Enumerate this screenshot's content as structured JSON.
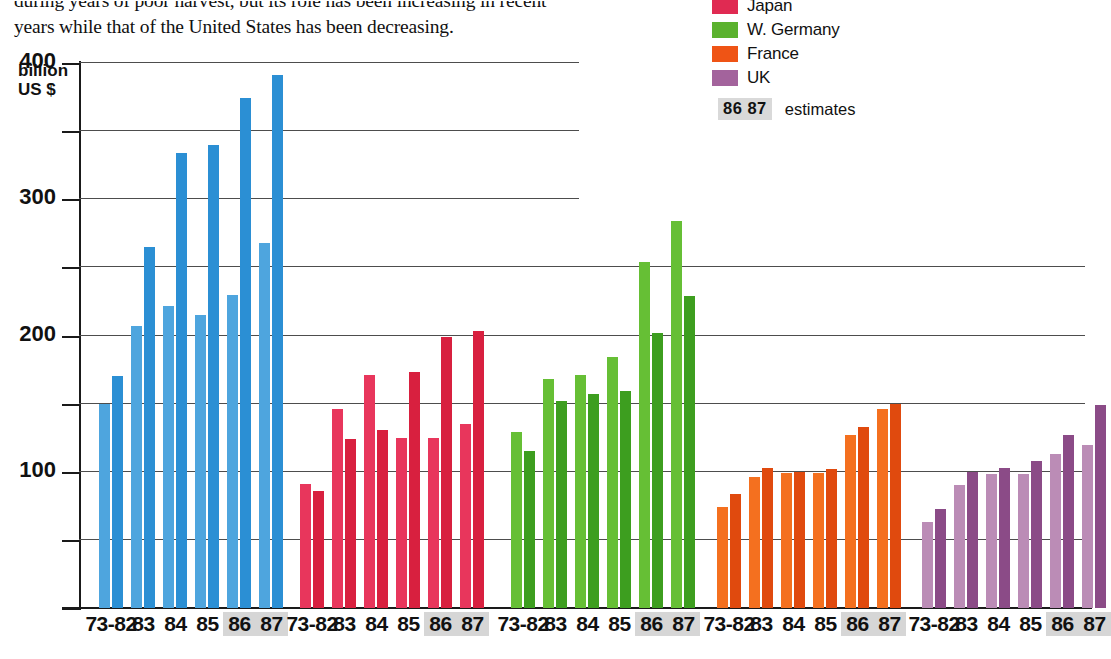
{
  "intro": {
    "line1": "during years of poor harvest, but its role has been increasing in recent",
    "line2": "years while that of the United States has been decreasing."
  },
  "caption": {
    "text": "World trade争 overall... in agricultural products, 1973- in current prices"
  },
  "legend": {
    "items": [
      {
        "label": "Japan",
        "color": "#e02a52"
      },
      {
        "label": "W. Germany",
        "color": "#5bb22e"
      },
      {
        "label": "France",
        "color": "#ef5415"
      },
      {
        "label": "UK",
        "color": "#a3639c"
      }
    ],
    "estimates": {
      "chip": "86 87",
      "word": "estimates"
    }
  },
  "axis": {
    "unit_line1": "billion",
    "unit_line2": "US $",
    "labels": [
      "400",
      "300",
      "200",
      "100"
    ]
  },
  "chart_data": {
    "type": "bar",
    "xlabel": "",
    "ylabel": "billion US $",
    "ylim": [
      0,
      400
    ],
    "yticks": [
      0,
      50,
      100,
      150,
      200,
      250,
      300,
      350,
      400
    ],
    "ytick_labels": [
      "",
      "",
      "100",
      "",
      "200",
      "",
      "300",
      "",
      "400"
    ],
    "grid": true,
    "legend_position": "top-right",
    "period_labels": [
      "73-82",
      "83",
      "84",
      "85",
      "86",
      "87"
    ],
    "estimate_periods": [
      "86",
      "87"
    ],
    "note": "each period shows a pair of bars (light = exports, dark = imports)",
    "series": [
      {
        "name": "United States",
        "color": "#2b8fd4",
        "color_light": "#4ea5de",
        "periods": [
          "73-82",
          "83",
          "84",
          "85",
          "86",
          "87"
        ],
        "values": [
          [
            150,
            170
          ],
          [
            207,
            265
          ],
          [
            222,
            334
          ],
          [
            215,
            340
          ],
          [
            230,
            374
          ],
          [
            268,
            391
          ]
        ]
      },
      {
        "name": "Japan",
        "color": "#d8203f",
        "color_light": "#e8365c",
        "periods": [
          "73-82",
          "83",
          "84",
          "85",
          "86",
          "87"
        ],
        "values": [
          [
            91,
            86
          ],
          [
            146,
            124
          ],
          [
            171,
            131
          ],
          [
            125,
            173
          ],
          [
            125,
            199
          ],
          [
            135,
            203
          ]
        ]
      },
      {
        "name": "W. Germany",
        "color": "#3d9e1f",
        "color_light": "#66bf35",
        "periods": [
          "73-82",
          "83",
          "84",
          "85",
          "86",
          "87"
        ],
        "values": [
          [
            129,
            115
          ],
          [
            168,
            152
          ],
          [
            171,
            157
          ],
          [
            184,
            159
          ],
          [
            254,
            202
          ],
          [
            284,
            229
          ]
        ]
      },
      {
        "name": "France",
        "color": "#e04a0e",
        "color_light": "#f4701f",
        "periods": [
          "73-82",
          "83",
          "84",
          "85",
          "86",
          "87"
        ],
        "values": [
          [
            74,
            84
          ],
          [
            96,
            103
          ],
          [
            99,
            100
          ],
          [
            99,
            102
          ],
          [
            127,
            133
          ],
          [
            146,
            150
          ]
        ]
      },
      {
        "name": "UK",
        "color": "#8b4b87",
        "color_light": "#bb8cb6",
        "periods": [
          "73-82",
          "83",
          "84",
          "85",
          "86",
          "87"
        ],
        "values": [
          [
            63,
            73
          ],
          [
            90,
            100
          ],
          [
            98,
            103
          ],
          [
            98,
            108
          ],
          [
            113,
            127
          ],
          [
            120,
            149
          ]
        ]
      }
    ]
  },
  "layout": {
    "group_x": [
      20,
      221,
      432,
      638,
      843
    ],
    "group_width": 163,
    "bar_width": 11,
    "bar_gap": 2,
    "pair_gap": 8
  }
}
